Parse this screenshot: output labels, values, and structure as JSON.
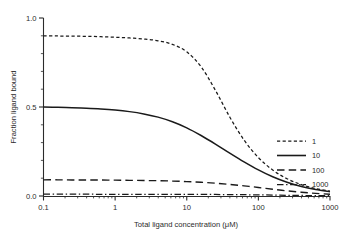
{
  "chart_data": {
    "type": "line",
    "title": "",
    "xlabel": "Total ligand concentration (μM)",
    "ylabel": "Fraction ligand bound",
    "xscale": "log",
    "yscale": "linear",
    "xlim": [
      0.1,
      1000
    ],
    "ylim": [
      0.0,
      1.0
    ],
    "grid": false,
    "legend_position": "right-middle",
    "legend_title": "",
    "xticks": [
      0.1,
      1,
      10,
      100,
      1000
    ],
    "xtick_labels": [
      "0.1",
      "1",
      "10",
      "100",
      "1000"
    ],
    "yticks": [
      0.0,
      0.5,
      1.0
    ],
    "ytick_labels": [
      "0.0",
      "0.5",
      "1.0"
    ],
    "yticks_minor": [
      0.1,
      0.2,
      0.3,
      0.4,
      0.6,
      0.7,
      0.8,
      0.9
    ],
    "x": [
      0.1,
      0.158,
      0.251,
      0.398,
      0.631,
      1.0,
      1.585,
      2.512,
      3.981,
      6.31,
      10.0,
      15.85,
      25.12,
      39.81,
      63.1,
      100.0,
      158.5,
      251.2,
      398.1,
      631.0,
      1000.0
    ],
    "series": [
      {
        "name": "1",
        "label": "1",
        "style": "short-dashed",
        "color": "#1a1a1a",
        "plateau": 0.9,
        "values": [
          0.9,
          0.899,
          0.898,
          0.897,
          0.895,
          0.892,
          0.888,
          0.882,
          0.872,
          0.852,
          0.81,
          0.726,
          0.594,
          0.444,
          0.314,
          0.216,
          0.146,
          0.097,
          0.064,
          0.042,
          0.027
        ]
      },
      {
        "name": "10",
        "label": "10",
        "style": "solid",
        "color": "#1a1a1a",
        "plateau": 0.5,
        "values": [
          0.5,
          0.498,
          0.496,
          0.493,
          0.489,
          0.483,
          0.474,
          0.461,
          0.443,
          0.417,
          0.383,
          0.34,
          0.292,
          0.241,
          0.192,
          0.147,
          0.108,
          0.077,
          0.053,
          0.036,
          0.024
        ]
      },
      {
        "name": "100",
        "label": "100",
        "style": "long-dashed",
        "color": "#1a1a1a",
        "plateau": 0.091,
        "values": [
          0.091,
          0.091,
          0.09,
          0.09,
          0.09,
          0.089,
          0.088,
          0.087,
          0.086,
          0.084,
          0.081,
          0.077,
          0.072,
          0.065,
          0.057,
          0.048,
          0.038,
          0.029,
          0.021,
          0.015,
          0.01
        ]
      },
      {
        "name": "1000",
        "label": "1000",
        "style": "dash-dot",
        "color": "#1a1a1a",
        "plateau": 0.0099,
        "values": [
          0.0099,
          0.0099,
          0.0099,
          0.0099,
          0.0098,
          0.0098,
          0.0098,
          0.0097,
          0.0096,
          0.0095,
          0.0093,
          0.009,
          0.0086,
          0.008,
          0.0072,
          0.0062,
          0.0051,
          0.0039,
          0.0029,
          0.0021,
          0.0015
        ]
      }
    ]
  }
}
